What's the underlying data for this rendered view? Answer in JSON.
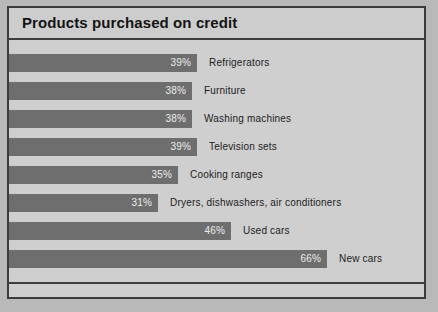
{
  "chart": {
    "title": "Products purchased on credit"
  },
  "chart_data": {
    "type": "bar",
    "orientation": "horizontal",
    "title": "Products purchased on credit",
    "xlabel": "",
    "ylabel": "",
    "xlim": [
      0,
      70
    ],
    "grid": false,
    "legend": null,
    "value_suffix": "%",
    "categories": [
      "Refrigerators",
      "Furniture",
      "Washing machines",
      "Television sets",
      "Cooking ranges",
      "Dryers, dishwashers, air conditioners",
      "Used cars",
      "New cars"
    ],
    "values": [
      39,
      38,
      38,
      39,
      35,
      31,
      46,
      66
    ],
    "value_labels": [
      "39%",
      "38%",
      "38%",
      "39%",
      "35%",
      "31%",
      "46%",
      "66%"
    ],
    "colors": {
      "bar": "#6e6e6e",
      "background": "#cfcfcf",
      "border": "#3b3b3b",
      "value_text": "#ededed",
      "label_text": "#1c1c1c"
    }
  }
}
